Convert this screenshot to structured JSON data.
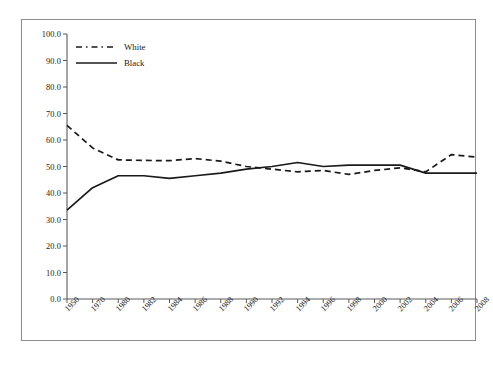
{
  "chart_data": {
    "type": "line",
    "title": "",
    "subtitle": "",
    "xlabel": "",
    "ylabel": "",
    "grid": false,
    "legend_position": "top-left",
    "ylim": [
      0.0,
      100.0
    ],
    "ytick_labels": [
      "0.0",
      "10.0",
      "20.0",
      "30.0",
      "40.0",
      "50.0",
      "60.0",
      "70.0",
      "80.0",
      "90.0",
      "100.0"
    ],
    "ytick_values": [
      0,
      10,
      20,
      30,
      40,
      50,
      60,
      70,
      80,
      90,
      100
    ],
    "categories": [
      "1950",
      "1970",
      "1980",
      "1982",
      "1984",
      "1986",
      "1988",
      "1990",
      "1992",
      "1994",
      "1996",
      "1998",
      "2000",
      "2002",
      "2004",
      "2006",
      "2008"
    ],
    "series": [
      {
        "name": "White",
        "style": "dashed",
        "color": "#1a1a1a",
        "values": [
          65.5,
          57.0,
          52.5,
          52.3,
          52.2,
          53.0,
          52.0,
          50.0,
          49.0,
          48.0,
          48.5,
          47.0,
          48.5,
          49.5,
          48.0,
          54.5,
          53.5
        ]
      },
      {
        "name": "Black",
        "style": "solid",
        "color": "#1a1a1a",
        "values": [
          33.5,
          42.0,
          46.5,
          46.5,
          45.5,
          46.5,
          47.5,
          49.0,
          50.0,
          51.5,
          50.0,
          50.5,
          50.5,
          50.5,
          47.5,
          47.5,
          47.5
        ]
      }
    ]
  },
  "legend": {
    "items": [
      {
        "label": "White",
        "style": "dashed"
      },
      {
        "label": "Black",
        "style": "solid"
      }
    ]
  }
}
